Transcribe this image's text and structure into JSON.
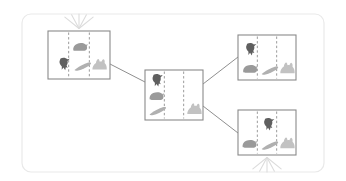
{
  "canvas": {
    "width": 346,
    "height": 181,
    "background": "#ffffff"
  },
  "container": {
    "label": "diagram-panel",
    "x": 22,
    "y": 14,
    "width": 302,
    "height": 158,
    "corner_radius": 9,
    "border_color": "#e9e9e9",
    "fill": "#ffffff"
  },
  "palette": {
    "node_border": "#8a8a8a",
    "node_fill": "#ffffff",
    "divider": "#9b9b9b",
    "edge": "#8f8f8f",
    "sparkle": "#dcdcdc",
    "piece_dark": "#5f5f5f",
    "piece_medium": "#9a9a9a",
    "piece_light": "#c2c2c2"
  },
  "pieces": {
    "bird": {
      "name": "bird-silhouette",
      "color": "#5f5f5f",
      "tone": "dark"
    },
    "hedgehog": {
      "name": "hedgehog-silhouette",
      "color": "#9a9a9a",
      "tone": "medium"
    },
    "feather": {
      "name": "feather-silhouette",
      "color": "#b0b0b0",
      "tone": "medium-light"
    },
    "rabbit": {
      "name": "rabbit-silhouette",
      "color": "#c2c2c2",
      "tone": "light"
    }
  },
  "nodes": [
    {
      "id": "node-top-left",
      "name": "state-node-top-left",
      "x": 48,
      "y": 31,
      "width": 62,
      "height": 48,
      "cells": 3,
      "sparkle": "top",
      "contents": [
        {
          "piece": "bird",
          "cell": 0,
          "cx": 0.26,
          "cy": 0.7,
          "scale": 1.0
        },
        {
          "piece": "hedgehog",
          "cell": 1,
          "cx": 0.52,
          "cy": 0.34,
          "scale": 1.0
        },
        {
          "piece": "feather",
          "cell": 1,
          "cx": 0.56,
          "cy": 0.74,
          "scale": 1.0
        },
        {
          "piece": "rabbit",
          "cell": 2,
          "cx": 0.82,
          "cy": 0.72,
          "scale": 1.0
        }
      ]
    },
    {
      "id": "node-center",
      "name": "state-node-center",
      "x": 145,
      "y": 70,
      "width": 58,
      "height": 50,
      "cells": 3,
      "sparkle": "none",
      "contents": [
        {
          "piece": "bird",
          "cell": 0,
          "cx": 0.21,
          "cy": 0.22,
          "scale": 1.0
        },
        {
          "piece": "hedgehog",
          "cell": 0,
          "cx": 0.2,
          "cy": 0.53,
          "scale": 1.0
        },
        {
          "piece": "feather",
          "cell": 0,
          "cx": 0.22,
          "cy": 0.82,
          "scale": 1.0
        },
        {
          "piece": "rabbit",
          "cell": 2,
          "cx": 0.84,
          "cy": 0.8,
          "scale": 1.0
        }
      ]
    },
    {
      "id": "node-top-right",
      "name": "state-node-top-right",
      "x": 238,
      "y": 35,
      "width": 58,
      "height": 45,
      "cells": 3,
      "sparkle": "none",
      "contents": [
        {
          "piece": "bird",
          "cell": 0,
          "cx": 0.22,
          "cy": 0.33,
          "scale": 1.0
        },
        {
          "piece": "hedgehog",
          "cell": 0,
          "cx": 0.21,
          "cy": 0.76,
          "scale": 1.0
        },
        {
          "piece": "feather",
          "cell": 1,
          "cx": 0.55,
          "cy": 0.79,
          "scale": 1.0
        },
        {
          "piece": "rabbit",
          "cell": 2,
          "cx": 0.84,
          "cy": 0.76,
          "scale": 1.0
        }
      ]
    },
    {
      "id": "node-bottom-right",
      "name": "state-node-bottom-right",
      "x": 238,
      "y": 110,
      "width": 58,
      "height": 45,
      "cells": 3,
      "sparkle": "bottom",
      "contents": [
        {
          "piece": "bird",
          "cell": 1,
          "cx": 0.53,
          "cy": 0.33,
          "scale": 1.0
        },
        {
          "piece": "hedgehog",
          "cell": 0,
          "cx": 0.2,
          "cy": 0.76,
          "scale": 1.0
        },
        {
          "piece": "feather",
          "cell": 1,
          "cx": 0.55,
          "cy": 0.79,
          "scale": 1.0
        },
        {
          "piece": "rabbit",
          "cell": 2,
          "cx": 0.84,
          "cy": 0.76,
          "scale": 1.0
        }
      ]
    }
  ],
  "edges": [
    {
      "id": "edge-topleft-center",
      "name": "edge-top-left-to-center",
      "from": "node-top-left",
      "to": "node-center",
      "x1": 110,
      "y1": 64,
      "x2": 145,
      "y2": 82
    },
    {
      "id": "edge-center-topright",
      "name": "edge-center-to-top-right",
      "from": "node-center",
      "to": "node-top-right",
      "x1": 203,
      "y1": 84,
      "x2": 238,
      "y2": 57
    },
    {
      "id": "edge-center-bottomright",
      "name": "edge-center-to-bottom-right",
      "from": "node-center",
      "to": "node-bottom-right",
      "x1": 203,
      "y1": 106,
      "x2": 238,
      "y2": 133
    }
  ],
  "sparkles": [
    {
      "id": "sparkle-top-left",
      "name": "sparkle-rays-top-left",
      "cx": 79,
      "cy": 31,
      "direction": "up",
      "ray_count": 5,
      "length": 17
    },
    {
      "id": "sparkle-bottom-right",
      "name": "sparkle-rays-bottom-right",
      "cx": 267,
      "cy": 155,
      "direction": "down",
      "ray_count": 5,
      "length": 17
    }
  ]
}
